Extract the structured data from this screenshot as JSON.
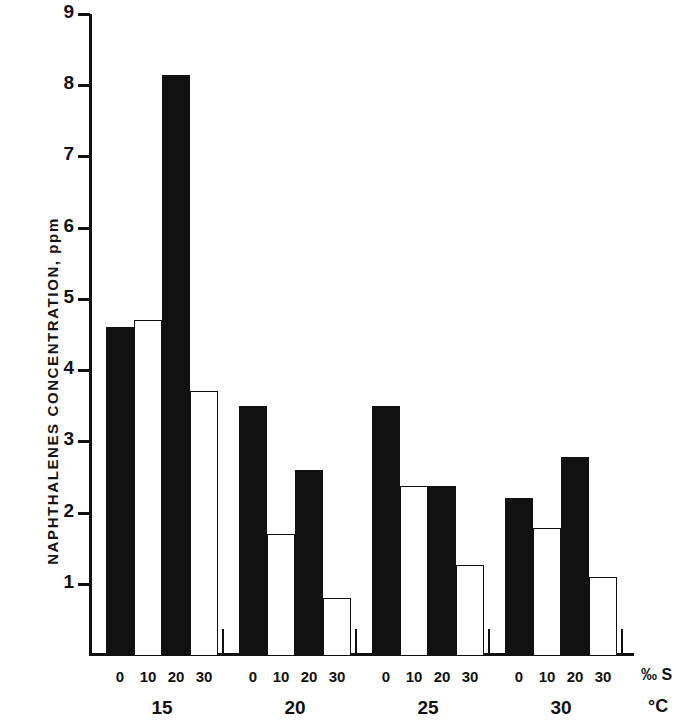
{
  "chart_data": {
    "type": "bar",
    "title": "",
    "subtitle": "",
    "xlabel": "",
    "ylabel": "NAPHTHALENES CONCENTRATION, ppm",
    "ylim": [
      0,
      9
    ],
    "ytick_values": [
      1,
      2,
      3,
      4,
      5,
      6,
      7,
      8,
      9
    ],
    "ytick_labels": [
      "1",
      "2",
      "3",
      "4",
      "5",
      "6",
      "7",
      "8",
      "9"
    ],
    "grid": false,
    "legend": null,
    "salinity_unit": "‰ S",
    "temperature_unit": "°C",
    "salinity_categories": [
      "0",
      "10",
      "20",
      "30"
    ],
    "temperature_groups": [
      "15",
      "20",
      "25",
      "30"
    ],
    "bar_styles": [
      "filled",
      "open",
      "filled",
      "open"
    ],
    "series": [
      {
        "name": "15 °C",
        "group_label": "15",
        "categories": [
          "0",
          "10",
          "20",
          "30"
        ],
        "values": [
          4.6,
          4.7,
          8.15,
          3.7
        ],
        "styles": [
          "filled",
          "open",
          "filled",
          "open"
        ]
      },
      {
        "name": "20 °C",
        "group_label": "20",
        "categories": [
          "0",
          "10",
          "20",
          "30"
        ],
        "values": [
          3.5,
          1.7,
          2.6,
          0.8
        ],
        "styles": [
          "filled",
          "open",
          "filled",
          "open"
        ]
      },
      {
        "name": "25 °C",
        "group_label": "25",
        "categories": [
          "0",
          "10",
          "20",
          "30"
        ],
        "values": [
          3.5,
          2.37,
          2.38,
          1.27
        ],
        "styles": [
          "filled",
          "open",
          "filled",
          "open"
        ]
      },
      {
        "name": "30 °C",
        "group_label": "30",
        "categories": [
          "0",
          "10",
          "20",
          "30"
        ],
        "values": [
          2.2,
          1.78,
          2.78,
          1.1
        ],
        "styles": [
          "filled",
          "open",
          "filled",
          "open"
        ]
      }
    ]
  },
  "colors": {
    "ink": "#111111",
    "background": "#ffffff",
    "bar_filled": "#111111",
    "bar_open": "#ffffff"
  }
}
